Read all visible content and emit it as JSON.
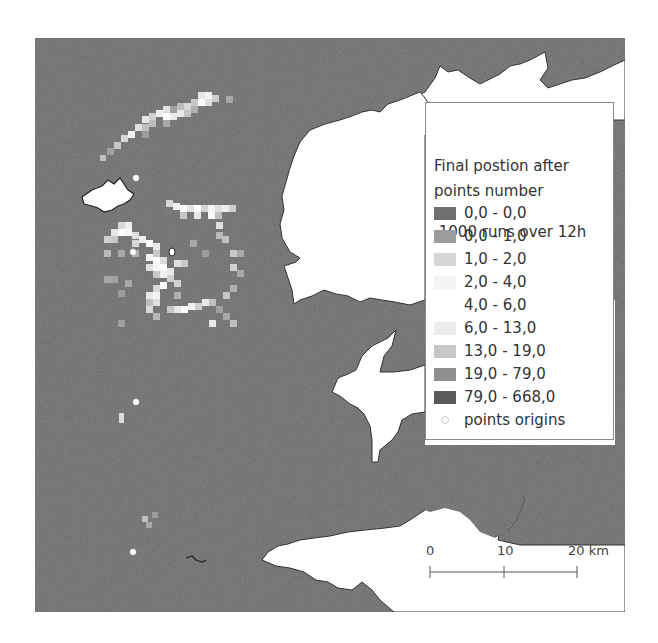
{
  "map": {
    "sea_color": "#6e6e6e",
    "land_color": "#ffffff",
    "frame": {
      "x": 35,
      "y": 38,
      "width": 590,
      "height": 574
    }
  },
  "legend": {
    "title_line1": "Final postion after",
    "title_line2": " 1000 runs over 12h",
    "subtitle": "points number",
    "items": [
      {
        "label": "0,0 - 0,0",
        "color": "#6f6f6f"
      },
      {
        "label": "0,0 - 1,0",
        "color": "#9c9c9c"
      },
      {
        "label": "1,0 - 2,0",
        "color": "#d6d6d6"
      },
      {
        "label": "2,0 - 4,0",
        "color": "#f4f4f4"
      },
      {
        "label": "4,0 - 6,0",
        "color": "#ffffff"
      },
      {
        "label": "6,0 - 13,0",
        "color": "#ececec"
      },
      {
        "label": "13,0 - 19,0",
        "color": "#c8c8c8"
      },
      {
        "label": "19,0 - 79,0",
        "color": "#8e8e8e"
      },
      {
        "label": "79,0 - 668,0",
        "color": "#5a5a5a"
      }
    ],
    "origins_label": "points origins"
  },
  "scalebar": {
    "labels": [
      "0",
      "10",
      "20 km"
    ]
  }
}
